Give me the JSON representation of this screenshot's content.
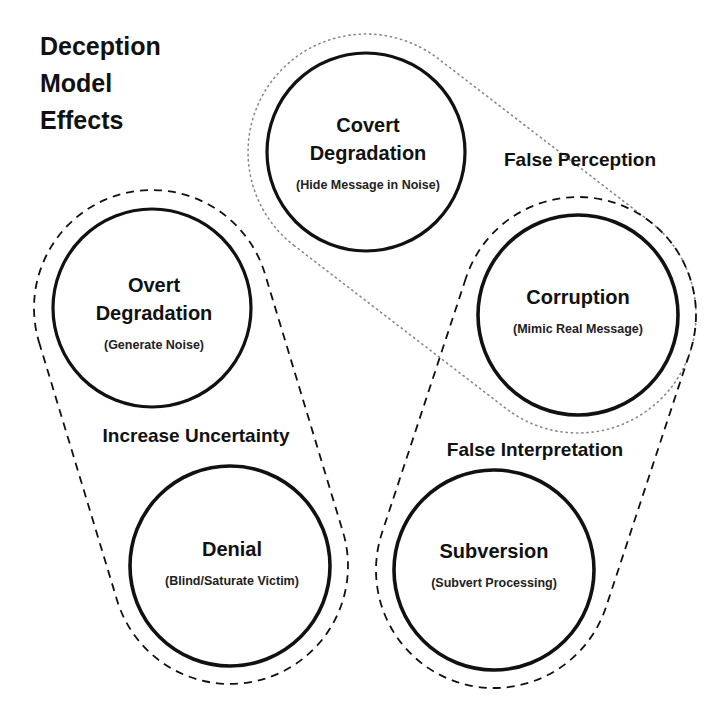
{
  "title": {
    "lines": [
      "Deception",
      "Model",
      "Effects"
    ]
  },
  "groups": {
    "increase_uncertainty": {
      "label": "Increase Uncertainty",
      "style": "dashed"
    },
    "false_perception": {
      "label": "False Perception",
      "style": "dotted"
    },
    "false_interpretation": {
      "label": "False Interpretation",
      "style": "dashed"
    }
  },
  "nodes": {
    "covert_degradation": {
      "title_lines": [
        "Covert",
        "Degradation"
      ],
      "subtitle": "(Hide Message in Noise)"
    },
    "overt_degradation": {
      "title_lines": [
        "Overt",
        "Degradation"
      ],
      "subtitle": "(Generate Noise)"
    },
    "corruption": {
      "title_lines": [
        "Corruption"
      ],
      "subtitle": "(Mimic Real Message)"
    },
    "denial": {
      "title_lines": [
        "Denial"
      ],
      "subtitle": "(Blind/Saturate Victim)"
    },
    "subversion": {
      "title_lines": [
        "Subversion"
      ],
      "subtitle": "(Subvert Processing)"
    }
  },
  "colors": {
    "stroke": "#111111",
    "dotted_stroke": "#888888",
    "background": "#ffffff"
  }
}
